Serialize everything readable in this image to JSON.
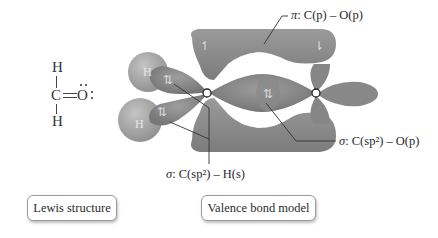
{
  "lewis": {
    "top_h": "H",
    "carbon": "C",
    "oxygen": "O",
    "bottom_h": "H",
    "double_bond": "=",
    "oxygen_lone_pairs": ":"
  },
  "orbital_model": {
    "h_label_top": "H",
    "h_label_bottom": "H",
    "electron_pair_symbol": "⇅",
    "single_electron_up": "↿",
    "single_electron_down": "⇂"
  },
  "labels": {
    "pi_bond": {
      "prefix": "π",
      "text": ": C(p) – O(p)"
    },
    "sigma_co": {
      "prefix": "σ",
      "text": ": C(sp²) – O(p)"
    },
    "sigma_ch": {
      "prefix": "σ",
      "text": ": C(sp²) – H(s)"
    }
  },
  "captions": {
    "lewis": "Lewis structure",
    "valence": "Valence bond model"
  },
  "colors": {
    "orbital_fill": "#8c8c8c",
    "orbital_dark": "#707070",
    "h_sphere": "#a8a8a8",
    "background": "#ffffff"
  }
}
